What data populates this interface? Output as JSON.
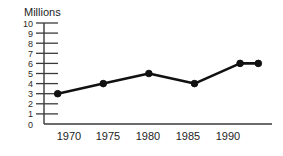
{
  "chart_data": {
    "type": "line",
    "title": "",
    "xlabel": "",
    "ylabel": "Millions",
    "ylim": [
      0,
      10
    ],
    "xlim": [
      1968.5,
      1993.5
    ],
    "grid": false,
    "legend": null,
    "y_ticks": [
      10,
      9,
      8,
      7,
      6,
      5,
      4,
      3,
      2,
      1,
      0
    ],
    "x_ticks": [
      1970,
      1975,
      1980,
      1985,
      1990
    ],
    "x_tick_labels": [
      "1970",
      "1975",
      "1980",
      "1985",
      "1990"
    ],
    "x": [
      1970,
      1975,
      1980,
      1985,
      1990,
      1992
    ],
    "values": [
      3,
      4,
      5,
      4,
      6,
      6
    ],
    "points": [
      {
        "x": 1970,
        "y": 3,
        "label": "1970"
      },
      {
        "x": 1975,
        "y": 4,
        "label": "1975"
      },
      {
        "x": 1980,
        "y": 5,
        "label": "1980"
      },
      {
        "x": 1985,
        "y": 4,
        "label": "1985"
      },
      {
        "x": 1990,
        "y": 6,
        "label": "1990"
      },
      {
        "x": 1992,
        "y": 6,
        "label": ""
      }
    ],
    "series": [
      {
        "name": "Millions",
        "values": [
          3,
          4,
          5,
          4,
          6,
          6
        ]
      }
    ],
    "colors": {
      "line": "#111111",
      "marker": "#111111",
      "axis": "#3a3a3a",
      "text": "#242424",
      "background": "#ffffff"
    }
  },
  "axis": {
    "y_title": "Millions",
    "y_labels": [
      "10",
      "9",
      "8",
      "7",
      "6",
      "5",
      "4",
      "3",
      "2",
      "1",
      "0"
    ],
    "x_labels": [
      "1970",
      "1975",
      "1980",
      "1985",
      "1990"
    ]
  }
}
